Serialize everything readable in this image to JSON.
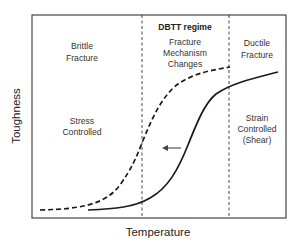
{
  "diagram": {
    "x_axis_label": "Temperature",
    "y_axis_label": "Toughness",
    "regions": {
      "left": {
        "line1": "Brittle",
        "line2": "Fracture",
        "note_line1": "Stress",
        "note_line2": "Controlled"
      },
      "middle": {
        "heading": "DBTT regime",
        "line1": "Fracture",
        "line2": "Mechanism",
        "line3": "Changes"
      },
      "right": {
        "line1": "Ductile",
        "line2": "Fracture",
        "note_line1": "Strain",
        "note_line2": "Controlled",
        "note_line3": "(Shear)"
      }
    },
    "curves": [
      {
        "name": "shifted-curve",
        "style": "dashed"
      },
      {
        "name": "original-curve",
        "style": "solid"
      }
    ],
    "arrow": {
      "direction": "left",
      "meaning": "transition shift to lower temperature"
    },
    "colors": {
      "line": "#1a1a1a",
      "text": "#333333",
      "background": "#ffffff"
    }
  }
}
